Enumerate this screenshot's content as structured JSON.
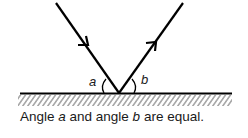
{
  "diagram": {
    "labels": {
      "angle_a": "a",
      "angle_b": "b"
    },
    "rays": [
      {
        "name": "incident-ray",
        "direction": "toward surface"
      },
      {
        "name": "reflected-ray",
        "direction": "away from surface"
      }
    ],
    "surface": "mirror (hatched)",
    "colors": {
      "line": "#000000",
      "hatch": "#777777"
    }
  },
  "caption": {
    "part1": "Angle ",
    "var_a": "a",
    "part2": " and angle ",
    "var_b": "b",
    "part3": " are equal."
  }
}
